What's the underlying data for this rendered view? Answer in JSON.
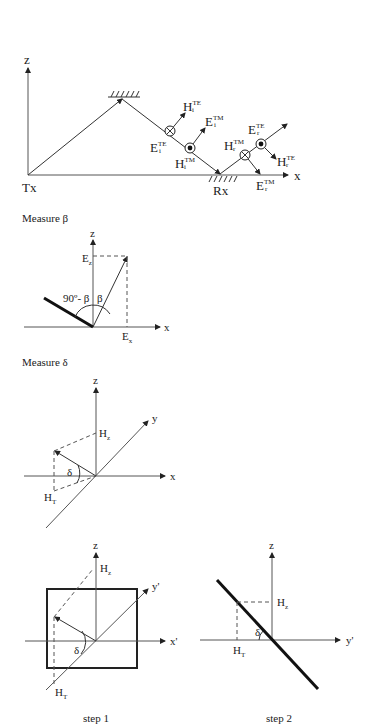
{
  "top_diagram": {
    "axis_z": "z",
    "axis_x": "x",
    "tx_label": "Tx",
    "rx_label": "Rx",
    "fields": {
      "Hi_TE": {
        "base": "H",
        "sup": "TE",
        "sub": "i"
      },
      "Ei_TM": {
        "base": "E",
        "sup": "TM",
        "sub": "i"
      },
      "Ei_TE": {
        "base": "E",
        "sup": "TE",
        "sub": "i"
      },
      "Hi_TM": {
        "base": "H",
        "sup": "TM",
        "sub": "i"
      },
      "Hr_TM": {
        "base": "H",
        "sup": "TM",
        "sub": "r"
      },
      "Er_TE": {
        "base": "E",
        "sup": "TE",
        "sub": "r"
      },
      "Hr_TE": {
        "base": "H",
        "sup": "TE",
        "sub": "r"
      },
      "Er_TM": {
        "base": "E",
        "sup": "TM",
        "sub": "r"
      }
    }
  },
  "beta_section": {
    "title": "Measure β",
    "axis_z": "z",
    "axis_x": "x",
    "ez_label": {
      "base": "E",
      "sub": "z"
    },
    "ex_label": {
      "base": "E",
      "sub": "x"
    },
    "angle_complement": "90º- β",
    "angle_beta": "β"
  },
  "delta_section": {
    "title": "Measure δ",
    "axis_z": "z",
    "axis_y": "y",
    "axis_x": "x",
    "hz_label": {
      "base": "H",
      "sub": "z"
    },
    "ht_label": {
      "base": "H",
      "sub": "T"
    },
    "angle_delta": "δ"
  },
  "step1": {
    "caption": "step 1",
    "axis_z": "z",
    "axis_y": "y'",
    "axis_x": "x'",
    "hz_label": {
      "base": "H",
      "sub": "z"
    },
    "ht_label": {
      "base": "H",
      "sub": "T"
    },
    "angle_delta": "δ"
  },
  "step2": {
    "caption": "step 2",
    "axis_z": "z",
    "axis_y": "y'",
    "hz_label": {
      "base": "H",
      "sub": "z"
    },
    "ht_label": {
      "base": "H",
      "sub": "T"
    },
    "angle_delta": "δ"
  }
}
